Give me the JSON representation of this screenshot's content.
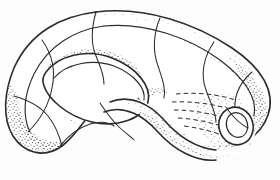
{
  "figure": {
    "kind": "line-drawing",
    "technique": "pen-and-ink stipple engraving",
    "background_color": "#fdfdfd",
    "ink_color": "#2b2b2b",
    "stipple_color": "#55545a",
    "canvas": {
      "width": 280,
      "height": 180
    },
    "ghost_text": ""
  },
  "parts": [
    {
      "id": "outer-tube",
      "name": "outer-tube-body",
      "description": "Large looping tube forming the main ring of the figure, shaded with stipple along its lower-left outer wall"
    },
    {
      "id": "inner-hole",
      "name": "inner-hole-ellipse",
      "description": "Tilted elliptical hole at the centre of the loop"
    },
    {
      "id": "crossing-arm",
      "name": "crossing-arm",
      "description": "Lower arm of the tube that sweeps right and passes behind the main ring"
    },
    {
      "id": "open-end",
      "name": "open-end-cap",
      "description": "Small circular open mouth of the tube at the lower right"
    },
    {
      "id": "hidden-contours",
      "name": "hidden-contour-lines",
      "description": "Dashed lines showing the occluded portion of the tube where it passes behind the ring"
    }
  ],
  "annotations": {
    "ring_count": 9,
    "hidden_line_count": 5,
    "has_caption": false,
    "has_axis": false,
    "has_legend": false
  }
}
